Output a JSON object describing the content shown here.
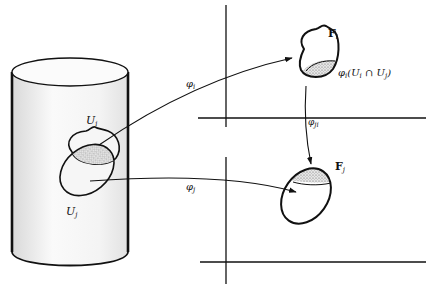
{
  "diagram": {
    "labels": {
      "U_i": "U",
      "U_i_sub": "i",
      "U_j": "U",
      "U_j_sub": "j",
      "phi_i": "φ",
      "phi_i_sub": "i",
      "phi_j": "φ",
      "phi_j_sub": "j",
      "phi_ji": "φ",
      "phi_ji_sub": "ji",
      "F_i": "F",
      "F_i_sub": "i",
      "F_j": "F",
      "F_j_sub": "j",
      "image_label_prefix": "φ",
      "image_label_sub": "i",
      "image_label_body": "(U",
      "image_label_sub2": "i",
      "image_label_cap": " ∩ U",
      "image_label_sub3": "j",
      "image_label_close": ")"
    },
    "colors": {
      "stroke": "#111111",
      "cylinder_fill": "#f2f2f2",
      "stipple": "#9a9a9a"
    }
  }
}
